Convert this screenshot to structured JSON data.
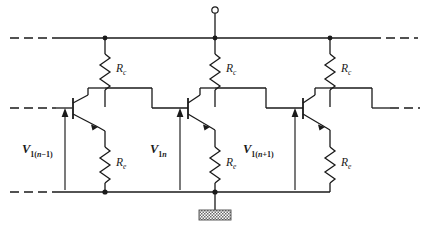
{
  "figure": {
    "stroke_color": "#1a1a1a",
    "background_color": "#ffffff",
    "line_width": 1.3
  },
  "rails": {
    "supply_rail_label": "supply-rail",
    "base_rail_label": "base-rail",
    "ground_rail_label": "ground-rail"
  },
  "supply_terminal": {
    "name": "supply-terminal",
    "shape": "open-circle"
  },
  "ground_symbol": {
    "name": "ground-symbol",
    "shape": "hatched-rectangle"
  },
  "collector_resistors": [
    {
      "label": "R",
      "sub": "c"
    },
    {
      "label": "R",
      "sub": "c"
    },
    {
      "label": "R",
      "sub": "c"
    }
  ],
  "emitter_resistors": [
    {
      "label": "R",
      "sub": "e"
    },
    {
      "label": "R",
      "sub": "e"
    },
    {
      "label": "R",
      "sub": "e"
    }
  ],
  "transistors": [
    {
      "name": "transistor-n-minus-1",
      "type": "npn"
    },
    {
      "name": "transistor-n",
      "type": "npn"
    },
    {
      "name": "transistor-n-plus-1",
      "type": "npn"
    }
  ],
  "voltage_sources": [
    {
      "label": "V",
      "sub_main": "1(",
      "sub_var": "n",
      "sub_op": "−1)",
      "full": "V1(n-1)"
    },
    {
      "label": "V",
      "sub_main": "1",
      "sub_var": "n",
      "sub_op": "",
      "full": "V1n"
    },
    {
      "label": "V",
      "sub_main": "1(",
      "sub_var": "n",
      "sub_op": "+1)",
      "full": "V1(n+1)"
    }
  ]
}
